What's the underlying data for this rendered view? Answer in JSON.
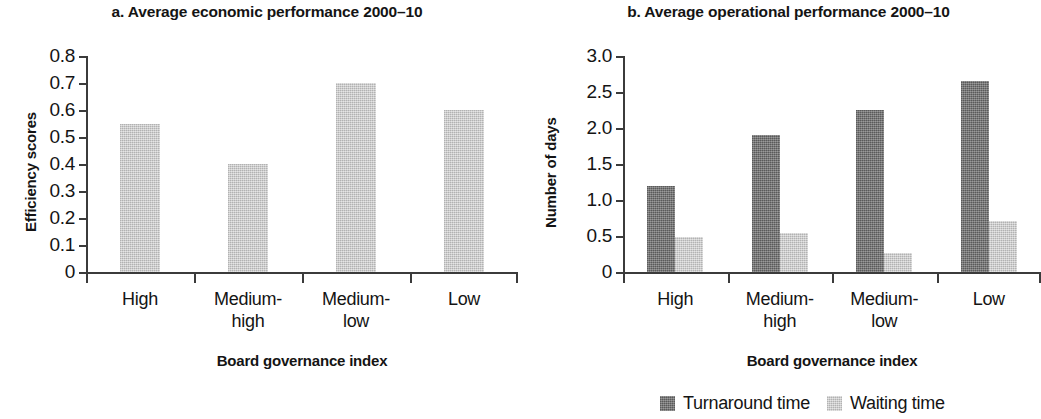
{
  "figure": {
    "panels": [
      {
        "id": "a",
        "title": "a. Average economic performance 2000–10",
        "ylabel": "Efficiency scores",
        "xlabel": "Board governance index"
      },
      {
        "id": "b",
        "title": "b. Average operational performance 2000–10",
        "ylabel": "Number of days",
        "xlabel": "Board governance index"
      }
    ],
    "legend": [
      {
        "label": "Turnaround time",
        "color": "#6f6f6f",
        "swatch": "legend-swatch-turnaround"
      },
      {
        "label": "Waiting time",
        "color": "#c6c6c6",
        "swatch": "legend-swatch-waiting"
      }
    ]
  },
  "chart_data": [
    {
      "type": "bar",
      "title": "a. Average economic performance 2000–10",
      "xlabel": "Board governance index",
      "ylabel": "Efficiency scores",
      "categories": [
        "High",
        "Medium-high",
        "Medium-low",
        "Low"
      ],
      "category_lines": [
        [
          "High",
          ""
        ],
        [
          "Medium-",
          "high"
        ],
        [
          "Medium-",
          "low"
        ],
        [
          "Low",
          ""
        ]
      ],
      "values": [
        0.55,
        0.4,
        0.7,
        0.6
      ],
      "series": [
        {
          "name": "Efficiency scores",
          "color": "#c6c6c6",
          "values": [
            0.55,
            0.4,
            0.7,
            0.6
          ]
        }
      ],
      "ylim": [
        0,
        0.8
      ],
      "yticks": [
        0,
        0.1,
        0.2,
        0.3,
        0.4,
        0.5,
        0.6,
        0.7,
        0.8
      ],
      "ytick_labels": [
        "0",
        "0.1",
        "0.2",
        "0.3",
        "0.4",
        "0.5",
        "0.6",
        "0.7",
        "0.8"
      ],
      "grid": false,
      "legend_position": "none"
    },
    {
      "type": "bar",
      "title": "b. Average operational performance 2000–10",
      "xlabel": "Board governance index",
      "ylabel": "Number of days",
      "categories": [
        "High",
        "Medium-high",
        "Medium-low",
        "Low"
      ],
      "category_lines": [
        [
          "High",
          ""
        ],
        [
          "Medium-",
          "high"
        ],
        [
          "Medium-",
          "low"
        ],
        [
          "Low",
          ""
        ]
      ],
      "series": [
        {
          "name": "Turnaround time",
          "color": "#6f6f6f",
          "values": [
            1.2,
            1.9,
            2.25,
            2.65
          ]
        },
        {
          "name": "Waiting time",
          "color": "#c6c6c6",
          "values": [
            0.48,
            0.54,
            0.27,
            0.71
          ]
        }
      ],
      "ylim": [
        0,
        3.0
      ],
      "yticks": [
        0,
        0.5,
        1.0,
        1.5,
        2.0,
        2.5,
        3.0
      ],
      "ytick_labels": [
        "0",
        "0.5",
        "1.0",
        "1.5",
        "2.0",
        "2.5",
        "3.0"
      ],
      "grid": false,
      "legend_position": "bottom"
    }
  ]
}
